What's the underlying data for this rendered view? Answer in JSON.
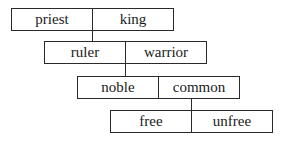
{
  "diagram": {
    "type": "stacked-dichotomy",
    "levels": [
      {
        "left": "priest",
        "right": "king"
      },
      {
        "left": "ruler",
        "right": "warrior"
      },
      {
        "left": "noble",
        "right": "common"
      },
      {
        "left": "free",
        "right": "unfree"
      }
    ],
    "colors": {
      "line": "#2a2a2a",
      "text": "#1a1a1a",
      "background": "#ffffff"
    }
  }
}
